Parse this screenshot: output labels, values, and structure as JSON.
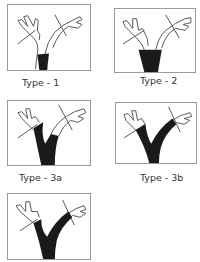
{
  "figure": {
    "panels": [
      {
        "id": "type-1",
        "label": "Type - 1"
      },
      {
        "id": "type-2",
        "label": "Type - 2"
      },
      {
        "id": "type-3a",
        "label": "Type - 3a"
      },
      {
        "id": "type-3b",
        "label": "Type - 3b"
      },
      {
        "id": "type-4",
        "label": ""
      }
    ],
    "colors": {
      "outline": "#555555",
      "fill": "#1a1a1a",
      "border": "#9a9a9a"
    }
  }
}
